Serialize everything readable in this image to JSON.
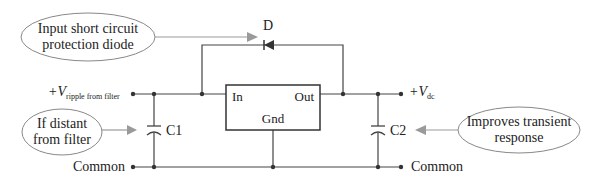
{
  "diagram": {
    "callouts": {
      "diode": {
        "line1": "Input short circuit",
        "line2": "protection diode"
      },
      "c1": {
        "line1": "If distant",
        "line2": "from filter"
      },
      "c2": {
        "line1": "Improves transient",
        "line2": "response"
      }
    },
    "components": {
      "diode_label": "D",
      "c1_label": "C1",
      "c2_label": "C2",
      "regulator": {
        "in": "In",
        "out": "Out",
        "gnd": "Gnd"
      }
    },
    "terminals": {
      "vin_main": "+V",
      "vin_sub": "ripple from filter",
      "vout_main": "+V",
      "vout_sub": "dc",
      "common_left": "Common",
      "common_right": "Common"
    },
    "colors": {
      "wire": "#444444",
      "callout": "#888888",
      "arrow": "#9a9a9a"
    }
  }
}
